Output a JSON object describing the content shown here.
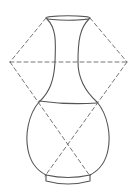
{
  "diagram": {
    "type": "line-drawing",
    "width": 136,
    "height": 195,
    "background": "#ffffff",
    "stroke_color": "#555555",
    "dash_color": "#666666",
    "solid_stroke_width": 1.1,
    "dashed_stroke_width": 0.9,
    "dash_pattern": "4 3",
    "elements": {
      "mouth_ellipse": {
        "cx": 68,
        "cy": 18,
        "rx": 22,
        "ry": 2.2
      },
      "neck_left": "M 47 19 C 56 28, 56 40, 55 62 C 54 80, 50 92, 39 102",
      "neck_right": "M 89 19 C 80 28, 78 40, 78 62 C 78 80, 86 92, 97 102",
      "shoulder_curve": "M 39 101 Q 68 105 97 103",
      "body_left": "M 39 102 C 28 115, 25 135, 28 150 C 31 165, 40 172, 46 175",
      "body_right": "M 97 102 C 108 115, 111 135, 108 150 C 105 165, 96 172, 90 175",
      "base_top": "M 46 175 Q 68 180 90 175",
      "base_ring": "M 46 175 L 46 181 Q 68 187 90 181 L 90 175",
      "dashed_horizontal": {
        "x1": 10,
        "y1": 62,
        "x2": 127,
        "y2": 62
      },
      "dashed_upper_left": {
        "x1": 46,
        "y1": 18,
        "x2": 10,
        "y2": 62
      },
      "dashed_upper_right": {
        "x1": 90,
        "y1": 18,
        "x2": 127,
        "y2": 62
      },
      "dashed_cross_a": {
        "x1": 10,
        "y1": 62,
        "x2": 90,
        "y2": 176
      },
      "dashed_cross_b": {
        "x1": 127,
        "y1": 62,
        "x2": 45,
        "y2": 176
      }
    },
    "labels": []
  }
}
